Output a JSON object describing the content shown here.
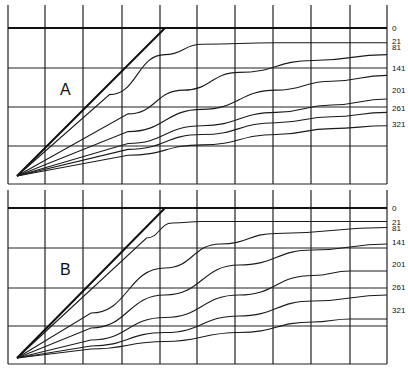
{
  "figure": {
    "panels": [
      {
        "id": "A",
        "label": "A",
        "curve_labels": [
          "0",
          "21",
          "81",
          "141",
          "201",
          "261",
          "321"
        ],
        "curves": [
          {
            "label": "0",
            "points": [
              [
                0,
                0
              ],
              [
                4,
                1.0
              ],
              [
                10,
                1.0
              ]
            ]
          },
          {
            "label": "21",
            "points": [
              [
                0,
                0
              ],
              [
                2.5,
                0.55
              ],
              [
                4,
                0.82
              ],
              [
                5,
                0.89
              ],
              [
                7,
                0.9
              ],
              [
                10,
                0.9
              ]
            ]
          },
          {
            "label": "81",
            "points": [
              [
                0,
                0
              ],
              [
                3,
                0.42
              ],
              [
                4.5,
                0.58
              ],
              [
                6,
                0.7
              ],
              [
                8,
                0.78
              ],
              [
                10,
                0.82
              ]
            ]
          },
          {
            "label": "141",
            "points": [
              [
                0,
                0
              ],
              [
                3,
                0.3
              ],
              [
                5,
                0.45
              ],
              [
                7,
                0.58
              ],
              [
                8.5,
                0.64
              ],
              [
                10,
                0.68
              ]
            ]
          },
          {
            "label": "201",
            "points": [
              [
                0,
                0
              ],
              [
                3,
                0.22
              ],
              [
                5,
                0.34
              ],
              [
                7,
                0.43
              ],
              [
                8.5,
                0.48
              ],
              [
                10,
                0.52
              ]
            ]
          },
          {
            "label": "261",
            "points": [
              [
                0,
                0
              ],
              [
                3,
                0.18
              ],
              [
                5,
                0.28
              ],
              [
                7,
                0.36
              ],
              [
                8.5,
                0.4
              ],
              [
                10,
                0.43
              ]
            ]
          },
          {
            "label": "321",
            "points": [
              [
                0,
                0
              ],
              [
                3,
                0.14
              ],
              [
                5,
                0.21
              ],
              [
                7,
                0.28
              ],
              [
                8.5,
                0.32
              ],
              [
                10,
                0.34
              ]
            ]
          }
        ]
      },
      {
        "id": "B",
        "label": "B",
        "curve_labels": [
          "0",
          "21",
          "81",
          "141",
          "201",
          "261",
          "321"
        ],
        "curves": [
          {
            "label": "0",
            "points": [
              [
                0,
                0
              ],
              [
                4,
                1.0
              ],
              [
                10,
                1.0
              ]
            ]
          },
          {
            "label": "21",
            "points": [
              [
                0,
                0
              ],
              [
                3.5,
                0.8
              ],
              [
                4.2,
                0.9
              ],
              [
                5,
                0.91
              ],
              [
                10,
                0.91
              ]
            ]
          },
          {
            "label": "81",
            "points": [
              [
                0,
                0
              ],
              [
                2,
                0.3
              ],
              [
                4,
                0.6
              ],
              [
                5.5,
                0.76
              ],
              [
                7,
                0.83
              ],
              [
                10,
                0.87
              ]
            ]
          },
          {
            "label": "141",
            "points": [
              [
                0,
                0
              ],
              [
                2,
                0.2
              ],
              [
                4,
                0.42
              ],
              [
                6,
                0.62
              ],
              [
                8,
                0.72
              ],
              [
                10,
                0.76
              ]
            ]
          },
          {
            "label": "201",
            "points": [
              [
                0,
                0
              ],
              [
                2,
                0.12
              ],
              [
                4,
                0.27
              ],
              [
                6,
                0.42
              ],
              [
                8,
                0.55
              ],
              [
                9,
                0.58
              ],
              [
                10,
                0.58
              ]
            ]
          },
          {
            "label": "261",
            "points": [
              [
                0,
                0
              ],
              [
                2,
                0.08
              ],
              [
                4,
                0.17
              ],
              [
                6,
                0.28
              ],
              [
                8,
                0.38
              ],
              [
                10,
                0.42
              ]
            ]
          },
          {
            "label": "321",
            "points": [
              [
                0,
                0
              ],
              [
                2,
                0.06
              ],
              [
                4,
                0.11
              ],
              [
                6,
                0.17
              ],
              [
                8,
                0.24
              ],
              [
                9,
                0.26
              ],
              [
                10,
                0.26
              ]
            ]
          }
        ]
      }
    ]
  }
}
